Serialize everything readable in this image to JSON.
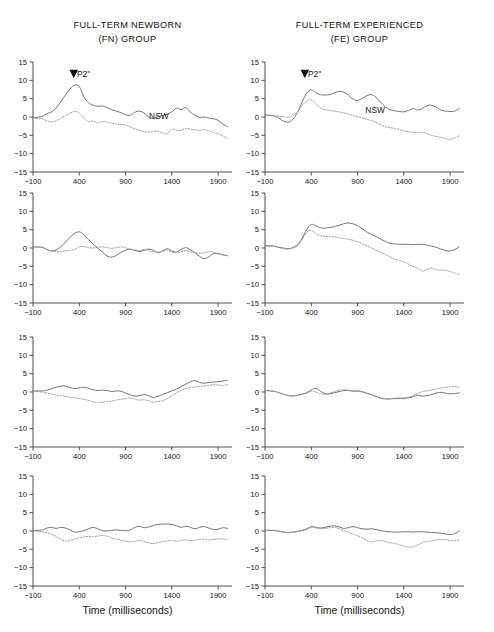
{
  "figure": {
    "width": 494,
    "height": 632,
    "background": "#ffffff",
    "trace_solid_color": "#6e6e6e",
    "trace_dotted_color": "#9a9a9a",
    "axis_color": "#3a3a3a",
    "marker_color": "#0d0d0d"
  },
  "columns": [
    {
      "title_line1": "FULL-TERM NEWBORN",
      "title_line2": "(FN) GROUP",
      "group_code": "FN"
    },
    {
      "title_line1": "FULL-TERM EXPERIENCED",
      "title_line2": "(FE) GROUP",
      "group_code": "FE"
    }
  ],
  "xlabel": "Time (milliseconds)",
  "axis": {
    "ylim": [
      -15,
      15
    ],
    "yticks": [
      15,
      10,
      5,
      0,
      -5,
      -10,
      -15
    ],
    "yticklabels": [
      "15",
      "10",
      "5",
      "0",
      "−5",
      "−10",
      "−15"
    ],
    "xlim": [
      -100,
      2050
    ],
    "xticks": [
      -100,
      400,
      900,
      1400,
      1900
    ],
    "xticklabels": [
      "−100",
      "400",
      "900",
      "1400",
      "1900"
    ],
    "grid": false
  },
  "annotations": {
    "p2_label": "\"P2\"",
    "nsw_label": "NSW",
    "p2_marker": "down-triangle-marker"
  },
  "chart_data": {
    "type": "line",
    "xlabel": "Time (milliseconds)",
    "ylabel": "",
    "xlim": [
      -100,
      2050
    ],
    "ylim": [
      -15,
      15
    ],
    "grid": false,
    "legend_position": "inline-annotation",
    "series_names": [
      "solid",
      "dotted"
    ],
    "x": [
      -100,
      0,
      50,
      100,
      150,
      200,
      250,
      300,
      350,
      400,
      450,
      500,
      550,
      600,
      650,
      700,
      750,
      800,
      850,
      900,
      950,
      1000,
      1050,
      1100,
      1150,
      1200,
      1250,
      1300,
      1350,
      1400,
      1450,
      1500,
      1550,
      1600,
      1650,
      1700,
      1750,
      1800,
      1850,
      1900,
      1950,
      2000
    ],
    "panels": [
      {
        "row": 1,
        "column": 1,
        "group": "FN",
        "annotations": [
          {
            "text": "\"P2\"",
            "x": 430,
            "y": 10.8,
            "marker": "down-triangle",
            "marker_x": 340,
            "marker_y": 11.5
          },
          {
            "text": "NSW",
            "x": 1260,
            "y": -0.6
          }
        ],
        "series": [
          {
            "name": "solid",
            "values": [
              -0.3,
              0.2,
              0.9,
              1.4,
              2.4,
              4.1,
              6.0,
              7.6,
              8.7,
              8.3,
              5.5,
              3.9,
              3.2,
              2.9,
              3.0,
              2.6,
              2.0,
              1.6,
              1.2,
              0.6,
              0.5,
              1.3,
              1.6,
              1.1,
              0.0,
              -0.4,
              0.1,
              0.4,
              0.8,
              1.4,
              2.4,
              2.0,
              2.6,
              1.3,
              0.5,
              -0.1,
              0.0,
              -0.3,
              -0.5,
              -0.9,
              -1.9,
              -2.6
            ]
          },
          {
            "name": "dotted",
            "values": [
              -0.4,
              -0.5,
              -1.0,
              -1.4,
              -1.0,
              -0.3,
              0.4,
              1.0,
              1.5,
              1.1,
              -0.3,
              -1.3,
              -1.1,
              -1.6,
              -1.2,
              -1.4,
              -1.7,
              -1.9,
              -2.0,
              -2.2,
              -2.7,
              -3.2,
              -3.6,
              -4.0,
              -4.1,
              -4.0,
              -3.8,
              -4.4,
              -4.5,
              -3.3,
              -3.6,
              -3.6,
              -3.1,
              -3.3,
              -3.5,
              -3.6,
              -3.5,
              -3.8,
              -4.2,
              -4.6,
              -5.2,
              -5.8
            ]
          }
        ]
      },
      {
        "row": 1,
        "column": 2,
        "group": "FE",
        "annotations": [
          {
            "text": "\"P2\"",
            "x": 420,
            "y": 10.8,
            "marker": "down-triangle",
            "marker_x": 330,
            "marker_y": 11.5
          },
          {
            "text": "NSW",
            "x": 1090,
            "y": 1.2
          }
        ],
        "series": [
          {
            "name": "solid",
            "values": [
              0.6,
              0.3,
              -0.3,
              -1.1,
              -1.4,
              -0.7,
              1.2,
              4.0,
              6.5,
              7.4,
              6.6,
              6.1,
              6.0,
              6.1,
              6.6,
              7.0,
              6.8,
              6.0,
              4.9,
              4.5,
              5.1,
              5.8,
              6.1,
              5.4,
              4.0,
              2.8,
              2.0,
              1.7,
              1.5,
              1.4,
              1.8,
              2.3,
              1.9,
              2.3,
              3.1,
              3.2,
              2.7,
              1.9,
              1.6,
              1.5,
              1.6,
              2.4
            ]
          },
          {
            "name": "dotted",
            "values": [
              0.5,
              0.3,
              0.2,
              0.1,
              -0.1,
              0.3,
              1.4,
              3.1,
              4.3,
              4.7,
              3.6,
              2.4,
              2.0,
              1.8,
              1.6,
              1.4,
              1.1,
              0.8,
              0.4,
              0.1,
              -0.2,
              -0.6,
              -1.0,
              -1.5,
              -2.1,
              -2.6,
              -2.9,
              -3.1,
              -3.4,
              -3.8,
              -4.0,
              -4.2,
              -4.3,
              -4.2,
              -4.5,
              -5.0,
              -5.3,
              -5.6,
              -5.9,
              -6.1,
              -5.7,
              -5.1
            ]
          }
        ]
      },
      {
        "row": 2,
        "column": 1,
        "group": "FN",
        "annotations": [],
        "series": [
          {
            "name": "solid",
            "values": [
              0.3,
              0.2,
              -0.4,
              -0.8,
              -0.5,
              0.3,
              1.6,
              2.9,
              4.0,
              4.4,
              3.6,
              2.3,
              1.1,
              0.0,
              -1.1,
              -2.2,
              -2.5,
              -2.0,
              -1.2,
              -0.6,
              -0.3,
              -0.6,
              -1.0,
              -0.6,
              -0.3,
              -0.6,
              -1.2,
              -0.8,
              -0.2,
              -0.8,
              -1.1,
              -0.4,
              0.1,
              -0.5,
              -1.3,
              -2.3,
              -2.9,
              -2.4,
              -1.5,
              -1.5,
              -1.8,
              -2.1
            ]
          },
          {
            "name": "dotted",
            "values": [
              0.3,
              0.1,
              -0.4,
              -0.8,
              -1.0,
              -1.0,
              -0.8,
              -0.6,
              -0.4,
              0.3,
              0.4,
              0.1,
              0.0,
              0.2,
              0.3,
              0.1,
              -0.1,
              0.1,
              0.3,
              0.1,
              -0.4,
              -0.5,
              -0.7,
              -0.4,
              -0.7,
              -1.0,
              -1.2,
              -0.9,
              -0.6,
              -1.1,
              -1.3,
              -1.0,
              -0.7,
              -1.0,
              -1.3,
              -1.4,
              -1.3,
              -1.0,
              -1.2,
              -1.6,
              -1.9,
              -2.1
            ]
          }
        ]
      },
      {
        "row": 2,
        "column": 2,
        "group": "FE",
        "annotations": [],
        "series": [
          {
            "name": "solid",
            "values": [
              0.7,
              0.5,
              0.2,
              0.0,
              -0.2,
              0.1,
              0.9,
              2.6,
              5.0,
              6.4,
              6.1,
              5.5,
              5.4,
              5.6,
              5.8,
              6.2,
              6.6,
              6.8,
              6.6,
              6.1,
              5.3,
              4.4,
              3.7,
              3.1,
              2.4,
              1.8,
              1.3,
              1.1,
              1.0,
              1.0,
              1.0,
              0.9,
              1.0,
              1.0,
              0.8,
              0.5,
              0.2,
              -0.3,
              -0.7,
              -0.8,
              -0.4,
              0.3
            ]
          },
          {
            "name": "dotted",
            "values": [
              0.5,
              0.4,
              0.1,
              -0.2,
              -0.3,
              0.0,
              0.6,
              2.2,
              4.2,
              4.8,
              3.9,
              3.3,
              3.2,
              3.1,
              3.0,
              2.8,
              2.6,
              2.4,
              2.1,
              1.7,
              1.2,
              0.6,
              0.0,
              -0.6,
              -1.2,
              -1.8,
              -2.4,
              -3.0,
              -3.4,
              -3.8,
              -4.4,
              -5.0,
              -5.6,
              -6.3,
              -5.8,
              -5.5,
              -5.9,
              -6.0,
              -6.1,
              -6.4,
              -6.8,
              -7.3
            ]
          }
        ]
      },
      {
        "row": 3,
        "column": 1,
        "group": "FN",
        "annotations": [],
        "series": [
          {
            "name": "solid",
            "values": [
              0.3,
              0.3,
              0.5,
              0.9,
              1.3,
              1.6,
              1.6,
              1.2,
              0.9,
              1.1,
              1.3,
              1.0,
              0.6,
              0.4,
              0.5,
              0.4,
              0.1,
              0.3,
              0.2,
              -0.3,
              -0.8,
              -1.1,
              -1.0,
              -0.7,
              -1.0,
              -1.5,
              -1.2,
              -0.6,
              -0.2,
              0.3,
              0.8,
              1.5,
              2.1,
              2.8,
              3.1,
              2.6,
              2.4,
              2.6,
              2.7,
              2.8,
              3.0,
              3.2
            ]
          },
          {
            "name": "dotted",
            "values": [
              0.2,
              0.0,
              -0.3,
              -0.6,
              -0.8,
              -1.0,
              -1.2,
              -1.4,
              -1.6,
              -1.8,
              -2.0,
              -2.3,
              -2.7,
              -2.9,
              -2.8,
              -2.6,
              -2.5,
              -2.2,
              -2.0,
              -1.8,
              -1.6,
              -1.9,
              -2.2,
              -2.1,
              -2.4,
              -2.7,
              -2.6,
              -2.4,
              -1.8,
              -1.0,
              -0.2,
              0.4,
              0.9,
              1.2,
              1.4,
              1.5,
              1.6,
              1.8,
              2.0,
              1.9,
              1.8,
              2.0
            ]
          }
        ]
      },
      {
        "row": 3,
        "column": 2,
        "group": "FE",
        "annotations": [],
        "series": [
          {
            "name": "solid",
            "values": [
              0.4,
              0.2,
              -0.2,
              -0.6,
              -1.0,
              -1.1,
              -0.9,
              -0.6,
              -0.2,
              0.6,
              1.0,
              0.2,
              -0.5,
              -0.5,
              -0.2,
              0.1,
              0.4,
              0.4,
              0.2,
              0.3,
              0.1,
              -0.3,
              -0.7,
              -1.2,
              -1.7,
              -1.9,
              -1.9,
              -1.8,
              -1.8,
              -1.8,
              -1.6,
              -1.3,
              -0.9,
              -1.1,
              -1.0,
              -0.7,
              -0.3,
              -0.1,
              -0.3,
              -0.5,
              -0.4,
              -0.2
            ]
          },
          {
            "name": "dotted",
            "values": [
              0.4,
              0.2,
              -0.2,
              -0.6,
              -0.9,
              -1.0,
              -0.9,
              -0.6,
              -0.3,
              0.2,
              0.0,
              -0.5,
              -0.6,
              -0.3,
              0.1,
              0.5,
              0.6,
              0.5,
              0.3,
              0.2,
              0.0,
              -0.4,
              -0.8,
              -1.3,
              -1.6,
              -1.8,
              -1.8,
              -1.7,
              -1.6,
              -1.6,
              -1.4,
              -1.0,
              -0.4,
              0.1,
              0.3,
              0.5,
              0.8,
              1.1,
              1.3,
              1.4,
              1.5,
              1.3
            ]
          }
        ]
      },
      {
        "row": 4,
        "column": 1,
        "group": "FN",
        "annotations": [],
        "series": [
          {
            "name": "solid",
            "values": [
              0.1,
              0.3,
              0.8,
              1.0,
              0.7,
              1.0,
              0.8,
              0.3,
              -0.3,
              -0.2,
              0.1,
              0.6,
              1.0,
              0.6,
              0.1,
              0.0,
              0.2,
              0.3,
              0.2,
              0.1,
              0.3,
              1.0,
              1.3,
              0.9,
              1.1,
              1.5,
              1.8,
              1.9,
              1.9,
              1.8,
              1.4,
              1.0,
              1.3,
              1.0,
              0.6,
              1.0,
              1.2,
              0.8,
              0.4,
              0.5,
              0.9,
              0.7
            ]
          },
          {
            "name": "dotted",
            "values": [
              0.0,
              -0.2,
              -0.5,
              -0.9,
              -1.5,
              -2.2,
              -2.8,
              -2.6,
              -2.2,
              -1.9,
              -1.6,
              -1.5,
              -1.6,
              -1.4,
              -1.2,
              -1.4,
              -1.8,
              -2.2,
              -2.5,
              -2.8,
              -3.0,
              -2.8,
              -2.6,
              -2.9,
              -3.2,
              -3.4,
              -3.2,
              -2.9,
              -2.7,
              -2.6,
              -2.8,
              -2.6,
              -2.4,
              -2.6,
              -2.5,
              -2.3,
              -2.2,
              -2.4,
              -2.3,
              -2.2,
              -2.2,
              -2.3
            ]
          }
        ]
      },
      {
        "row": 4,
        "column": 2,
        "group": "FE",
        "annotations": [],
        "series": [
          {
            "name": "solid",
            "values": [
              0.2,
              0.1,
              -0.1,
              -0.3,
              -0.4,
              -0.3,
              -0.1,
              0.2,
              0.6,
              1.2,
              1.0,
              0.8,
              1.0,
              1.3,
              1.4,
              1.1,
              0.7,
              0.9,
              1.2,
              0.9,
              0.6,
              0.5,
              0.6,
              0.4,
              0.1,
              -0.1,
              -0.2,
              -0.3,
              -0.3,
              -0.2,
              -0.2,
              -0.3,
              -0.2,
              -0.2,
              -0.3,
              -0.4,
              -0.5,
              -0.6,
              -0.8,
              -1.0,
              -0.7,
              0.0
            ]
          },
          {
            "name": "dotted",
            "values": [
              0.2,
              0.2,
              0.0,
              -0.3,
              -0.5,
              -0.4,
              -0.2,
              0.1,
              0.4,
              0.9,
              0.8,
              0.6,
              0.7,
              0.9,
              1.0,
              0.6,
              0.1,
              -0.3,
              -0.8,
              -1.3,
              -1.9,
              -2.6,
              -3.0,
              -2.7,
              -2.6,
              -2.9,
              -3.2,
              -3.4,
              -3.7,
              -4.1,
              -4.4,
              -4.3,
              -3.8,
              -3.2,
              -2.9,
              -2.7,
              -2.5,
              -2.3,
              -2.4,
              -2.6,
              -2.7,
              -2.4
            ]
          }
        ]
      }
    ]
  }
}
